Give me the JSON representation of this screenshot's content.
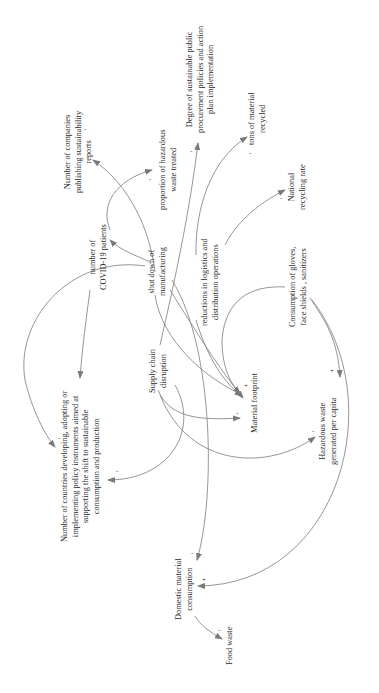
{
  "diagram": {
    "type": "causal-loop-diagram",
    "orientation": "rotated-90-ccw",
    "line_color": "#808080",
    "text_color": "#2a2a2a",
    "nodes": [
      {
        "id": "companies_reports",
        "lines": [
          "Number of companies",
          "publishing sustainability",
          "reports"
        ]
      },
      {
        "id": "hazardous_treated",
        "lines": [
          "proportion of hazardous",
          "waste treated"
        ]
      },
      {
        "id": "public_procurement",
        "lines": [
          "Degree of sustainable public",
          "procurement policies and action",
          "plan implementation"
        ]
      },
      {
        "id": "tons_recycled",
        "lines": [
          "tons of material",
          "recycled"
        ]
      },
      {
        "id": "national_recycling",
        "lines": [
          "National",
          "recycling rate"
        ]
      },
      {
        "id": "covid_patients",
        "lines": [
          "number of",
          "COVID-19 patients"
        ]
      },
      {
        "id": "shutdown",
        "lines": [
          "shut down of",
          "manufacturing"
        ]
      },
      {
        "id": "logistics",
        "lines": [
          "reductions in logistics and",
          "distribution operations"
        ]
      },
      {
        "id": "gloves",
        "lines": [
          "Consumption of gloves,",
          "face shields , sanitizers"
        ]
      },
      {
        "id": "supply_chain",
        "lines": [
          "Supply chain",
          "disruption"
        ]
      },
      {
        "id": "material_footprint",
        "lines": [
          "Material footprint"
        ]
      },
      {
        "id": "hazardous_per_capita",
        "lines": [
          "Hazardous waste",
          "generated per capita"
        ]
      },
      {
        "id": "policy_instruments",
        "lines": [
          "Number of countries developing, adopting or",
          "implementing policy instruments aimed at",
          "supporting the shift to sustainable",
          "consumption and production"
        ]
      },
      {
        "id": "domestic_consumption",
        "lines": [
          "Domestic material",
          "consumption"
        ]
      },
      {
        "id": "food_waste",
        "lines": [
          "Food waste"
        ]
      }
    ],
    "links": [
      {
        "from": "shutdown",
        "to": "companies_reports",
        "polarity": "-"
      },
      {
        "from": "covid_patients",
        "to": "hazardous_treated",
        "polarity": "-"
      },
      {
        "from": "supply_chain",
        "to": "public_procurement",
        "polarity": "-"
      },
      {
        "from": "logistics",
        "to": "tons_recycled",
        "polarity": "-"
      },
      {
        "from": "gloves",
        "to": "national_recycling",
        "polarity": "-"
      },
      {
        "from": "shutdown",
        "to": "covid_patients",
        "polarity": ""
      },
      {
        "from": "shutdown",
        "to": "policy_instruments",
        "polarity": "-"
      },
      {
        "from": "covid_patients",
        "to": "policy_instruments",
        "polarity": "-"
      },
      {
        "from": "shutdown",
        "to": "material_footprint",
        "polarity": "-"
      },
      {
        "from": "supply_chain",
        "to": "material_footprint",
        "polarity": "-"
      },
      {
        "from": "logistics",
        "to": "material_footprint",
        "polarity": "-"
      },
      {
        "from": "gloves",
        "to": "material_footprint",
        "polarity": "+"
      },
      {
        "from": "gloves",
        "to": "hazardous_per_capita",
        "polarity": "+"
      },
      {
        "from": "supply_chain",
        "to": "hazardous_per_capita",
        "polarity": "-"
      },
      {
        "from": "supply_chain",
        "to": "policy_instruments",
        "polarity": "-"
      },
      {
        "from": "shutdown",
        "to": "domestic_consumption",
        "polarity": "-"
      },
      {
        "from": "gloves",
        "to": "domestic_consumption",
        "polarity": "+"
      },
      {
        "from": "domestic_consumption",
        "to": "food_waste",
        "polarity": "-"
      }
    ]
  }
}
